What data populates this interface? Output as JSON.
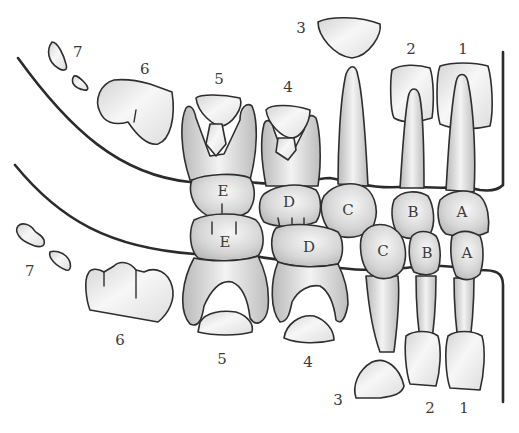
{
  "diagram": {
    "type": "mixed-dentition-chart",
    "colors": {
      "outline": "#2e2e2e",
      "gum_line": "#2b2b2b",
      "tooth_light": "#f2f2f2",
      "tooth_shade": "#c8c8c8",
      "label": "#3a3a3a",
      "background": "#ffffff"
    },
    "upper": {
      "permanent_labels": [
        "1",
        "2",
        "3",
        "4",
        "5",
        "6",
        "7"
      ],
      "primary_labels": [
        "A",
        "B",
        "C",
        "D",
        "E"
      ]
    },
    "lower": {
      "permanent_labels": [
        "1",
        "2",
        "3",
        "4",
        "5",
        "6",
        "7"
      ],
      "primary_labels": [
        "A",
        "B",
        "C",
        "D",
        "E"
      ]
    },
    "labels": {
      "u1": "1",
      "u2": "2",
      "u3": "3",
      "u4": "4",
      "u5": "5",
      "u6": "6",
      "u7": "7",
      "l1": "1",
      "l2": "2",
      "l3": "3",
      "l4": "4",
      "l5": "5",
      "l6": "6",
      "l7": "7",
      "uA": "A",
      "uB": "B",
      "uC": "C",
      "uD": "D",
      "uE": "E",
      "lA": "A",
      "lB": "B",
      "lC": "C",
      "lD": "D",
      "lE": "E"
    }
  }
}
